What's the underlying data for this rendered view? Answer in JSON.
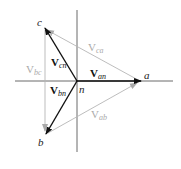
{
  "diagram": {
    "type": "phasor diagram",
    "colors": {
      "axis": "#444444",
      "phase_vector": "#111111",
      "line_vector": "#b5b5b5",
      "line_label": "#aaaaaa"
    },
    "origin": {
      "label": "n"
    },
    "points": {
      "a": {
        "label": "a"
      },
      "b": {
        "label": "b"
      },
      "c": {
        "label": "c"
      }
    },
    "phase_vectors": [
      {
        "id": "Van",
        "main": "V",
        "sub": "an",
        "from": "n",
        "to": "a"
      },
      {
        "id": "Vbn",
        "main": "V",
        "sub": "bn",
        "from": "n",
        "to": "b"
      },
      {
        "id": "Vcn",
        "main": "V",
        "sub": "cn",
        "from": "n",
        "to": "c"
      }
    ],
    "line_vectors": [
      {
        "id": "Vab",
        "main": "V",
        "sub": "ab",
        "from": "b",
        "to": "a"
      },
      {
        "id": "Vbc",
        "main": "V",
        "sub": "bc",
        "from": "c",
        "to": "b"
      },
      {
        "id": "Vca",
        "main": "V",
        "sub": "ca",
        "from": "a",
        "to": "c"
      }
    ]
  }
}
